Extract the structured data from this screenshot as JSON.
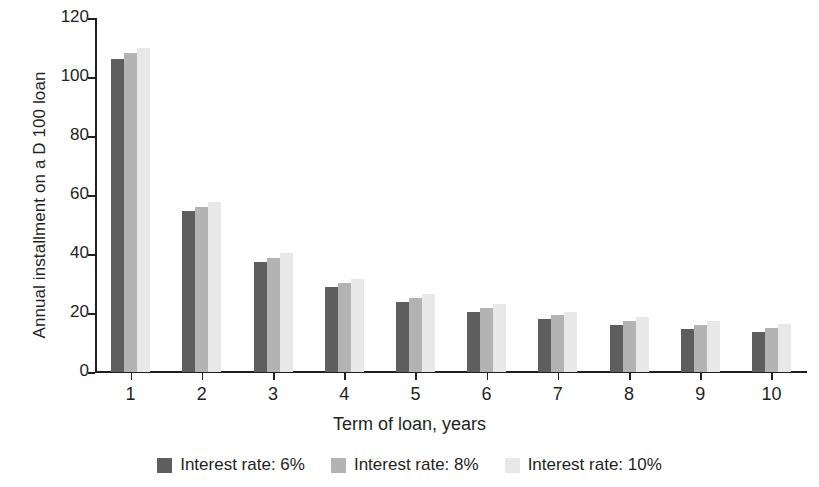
{
  "chart_data": {
    "type": "bar",
    "title": "",
    "xlabel": "Term of loan, years",
    "ylabel": "Annual installment on a D 100 loan",
    "categories": [
      "1",
      "2",
      "3",
      "4",
      "5",
      "6",
      "7",
      "8",
      "9",
      "10"
    ],
    "series": [
      {
        "name": "Interest rate: 6%",
        "color": "#5e5e5e",
        "values": [
          106.0,
          54.5,
          37.4,
          28.9,
          23.7,
          20.3,
          17.9,
          16.1,
          14.7,
          13.6
        ]
      },
      {
        "name": "Interest rate: 8%",
        "color": "#b3b3b3",
        "values": [
          108.0,
          56.1,
          38.8,
          30.2,
          25.0,
          21.6,
          19.2,
          17.4,
          16.0,
          14.9
        ]
      },
      {
        "name": "Interest rate: 10%",
        "color": "#e8e8e8",
        "values": [
          110.0,
          57.6,
          40.2,
          31.5,
          26.4,
          23.0,
          20.5,
          18.7,
          17.4,
          16.3
        ]
      }
    ],
    "ylim": [
      0,
      120
    ],
    "yticks": [
      0,
      20,
      40,
      60,
      80,
      100,
      120
    ],
    "ytick_labels": [
      "0",
      "20",
      "40",
      "60",
      "80",
      "100",
      "120"
    ],
    "grid": false,
    "legend_position": "bottom"
  },
  "axes": {
    "y_title": "Annual installment on a D 100 loan",
    "x_title": "Term of loan, years"
  },
  "legend": {
    "items": [
      {
        "label": "Interest rate: 6%",
        "color": "#5e5e5e"
      },
      {
        "label": "Interest rate: 8%",
        "color": "#b3b3b3"
      },
      {
        "label": "Interest rate: 10%",
        "color": "#e8e8e8"
      }
    ]
  }
}
